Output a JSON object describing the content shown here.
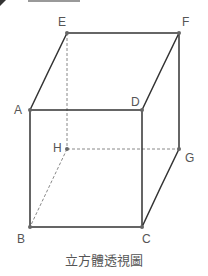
{
  "diagram": {
    "caption": "立方體透視圖",
    "colors": {
      "edge": "#333333",
      "hidden_edge": "#888888",
      "vertex": "#666666",
      "label": "#555555"
    },
    "vertices": {
      "A": {
        "label": "A",
        "x": 30,
        "y": 110
      },
      "B": {
        "label": "B",
        "x": 30,
        "y": 227
      },
      "C": {
        "label": "C",
        "x": 142,
        "y": 227
      },
      "D": {
        "label": "D",
        "x": 142,
        "y": 110
      },
      "E": {
        "label": "E",
        "x": 67,
        "y": 33
      },
      "F": {
        "label": "F",
        "x": 179,
        "y": 33
      },
      "G": {
        "label": "G",
        "x": 179,
        "y": 149
      },
      "H": {
        "label": "H",
        "x": 67,
        "y": 149
      }
    },
    "visible_edges": [
      "AB",
      "BC",
      "CD",
      "DA",
      "AE",
      "EF",
      "FD",
      "FG",
      "GC"
    ],
    "hidden_edges": [
      "EH",
      "HG",
      "HB"
    ]
  }
}
